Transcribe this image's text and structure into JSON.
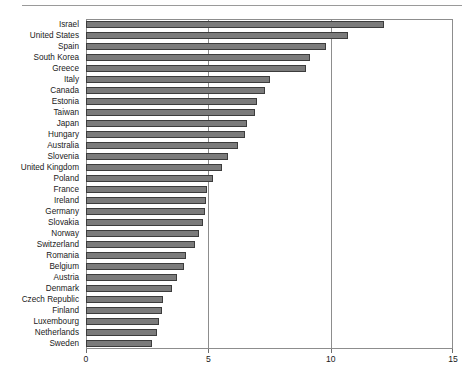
{
  "chart_data": {
    "type": "bar",
    "orientation": "horizontal",
    "title": "",
    "subtitle": "",
    "xlabel": "",
    "ylabel": "",
    "xlim": [
      0,
      15
    ],
    "xticks": [
      0,
      5,
      10,
      15
    ],
    "xtick_labels": [
      "0",
      "5",
      "10",
      "15"
    ],
    "grid": true,
    "gridlines_at": [
      5,
      10
    ],
    "legend": null,
    "bar_color": "#7b7b7b",
    "bar_edge_color": "#3c3c3c",
    "frame_color": "#8d8d8d",
    "categories": [
      "Israel",
      "United States",
      "Spain",
      "South Korea",
      "Greece",
      "Italy",
      "Canada",
      "Estonia",
      "Taiwan",
      "Japan",
      "Hungary",
      "Australia",
      "Slovenia",
      "United Kingdom",
      "Poland",
      "France",
      "Ireland",
      "Germany",
      "Slovakia",
      "Norway",
      "Switzerland",
      "Romania",
      "Belgium",
      "Austria",
      "Denmark",
      "Czech Republic",
      "Finland",
      "Luxembourg",
      "Netherlands",
      "Sweden"
    ],
    "values": [
      12.2,
      10.7,
      9.8,
      9.15,
      9.0,
      7.5,
      7.3,
      7.0,
      6.9,
      6.6,
      6.5,
      6.2,
      5.8,
      5.55,
      5.2,
      4.95,
      4.9,
      4.85,
      4.8,
      4.6,
      4.45,
      4.1,
      4.0,
      3.7,
      3.5,
      3.15,
      3.1,
      3.0,
      2.9,
      2.7
    ]
  }
}
